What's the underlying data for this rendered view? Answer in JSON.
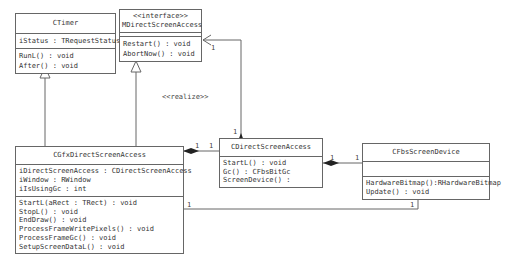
{
  "diagram": {
    "type": "UML class diagram",
    "classes": {
      "ctimer": {
        "name": "CTimer",
        "attributes": [
          "iStatus : TRequestStatus"
        ],
        "operations": [
          "RunL() : void",
          "After() : void"
        ]
      },
      "mdsa": {
        "stereotype": "<<interface>>",
        "name": "MDirectScreenAccess",
        "attributes": [],
        "operations": [
          "Restart() : void",
          "AbortNow() : void"
        ]
      },
      "cgfx": {
        "name": "CGfxDirectScreenAccess",
        "attributes": [
          "iDirectScreenAccess : CDirectScreenAccess",
          "iWindow : RWindow",
          "iIsUsingGc : int"
        ],
        "operations": [
          "StartL(aRect : TRect) : void",
          "StopL() : void",
          "EndDraw() : void",
          "ProcessFrameWritePixels() : void",
          "ProcessFrameGc() : void",
          "SetupScreenDataL() : void"
        ]
      },
      "cdsa": {
        "name": "CDirectScreenAccess",
        "operations": [
          "StartL() : void",
          "Gc() : CFbsBitGc",
          "ScreenDevice() :"
        ]
      },
      "cfbs": {
        "name": "CFbsScreenDevice",
        "attributes": [],
        "operations": [
          "HardwareBitmap():RHardwareBitmap",
          "Update() : void"
        ]
      }
    },
    "labels": {
      "realize": "<<realize>>",
      "mult_mdsa_in": "1",
      "mult_cdsa_top": "1",
      "mult_cgfx_cdsa_left": "1",
      "mult_cgfx_cdsa_right": "1",
      "mult_cdsa_cfbs_left": "1",
      "mult_cdsa_cfbs_right": "1",
      "mult_cgfx_cfbs_left": "1",
      "mult_cgfx_cfbs_right": "1"
    }
  }
}
